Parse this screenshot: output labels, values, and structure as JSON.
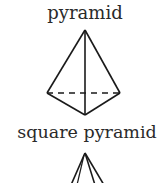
{
  "figures": [
    {
      "label": "pyramid",
      "shape": "pyramid-wireframe",
      "vertices": {
        "apex": [
          85,
          30
        ],
        "left": [
          47,
          93
        ],
        "right": [
          120,
          93
        ],
        "front": [
          85,
          115
        ]
      },
      "dashed_edge": "left-right"
    },
    {
      "label": "square pyramid",
      "shape": "square-pyramid-wireframe-partial",
      "apex": [
        85,
        153
      ]
    }
  ],
  "colors": {
    "stroke": "#1a1a1a",
    "text": "#2a2a2a",
    "background": "#ffffff"
  }
}
